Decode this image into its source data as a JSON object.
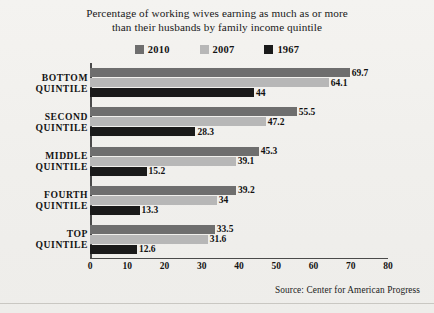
{
  "title": {
    "line1": "Percentage of working wives earning as much as or more",
    "line2": "than their husbands by family income quintile"
  },
  "legend": {
    "position": "top-center",
    "items": [
      {
        "label": "2010",
        "color": "#6e6e6e"
      },
      {
        "label": "2007",
        "color": "#b7b7b7"
      },
      {
        "label": "1967",
        "color": "#1a1a1a"
      }
    ]
  },
  "source": "Source:  Center for American Progress",
  "colors": {
    "background": "#f2f1ee",
    "axis": "#4a4a4a",
    "text": "#141414",
    "series_2010": "#6e6e6e",
    "series_2007": "#b7b7b7",
    "series_1967": "#1a1a1a"
  },
  "chart_data": {
    "type": "bar",
    "orientation": "horizontal",
    "title": "Percentage of working wives earning as much as or more than their husbands by family income quintile",
    "xlabel": "",
    "ylabel": "",
    "xlim": [
      0,
      80
    ],
    "xticks": [
      0,
      10,
      20,
      30,
      40,
      50,
      60,
      70,
      80
    ],
    "grid": false,
    "legend_position": "top-center",
    "categories": [
      "BOTTOM QUINTILE",
      "SECOND QUINTILE",
      "MIDDLE QUINTILE",
      "FOURTH QUINTILE",
      "TOP QUINTILE"
    ],
    "series": [
      {
        "name": "2010",
        "color": "#6e6e6e",
        "values": [
          69.7,
          55.5,
          45.3,
          39.2,
          33.5
        ],
        "labels": [
          "69.7",
          "55.5",
          "45.3",
          "39.2",
          "33.5"
        ]
      },
      {
        "name": "2007",
        "color": "#b7b7b7",
        "values": [
          64.1,
          47.2,
          39.1,
          34,
          31.6
        ],
        "labels": [
          "64.1",
          "47.2",
          "39.1",
          "34",
          "31.6"
        ]
      },
      {
        "name": "1967",
        "color": "#1a1a1a",
        "values": [
          44,
          28.3,
          15.2,
          13.3,
          12.6
        ],
        "labels": [
          "44",
          "28.3",
          "15.2",
          "13.3",
          "12.6"
        ]
      }
    ]
  }
}
